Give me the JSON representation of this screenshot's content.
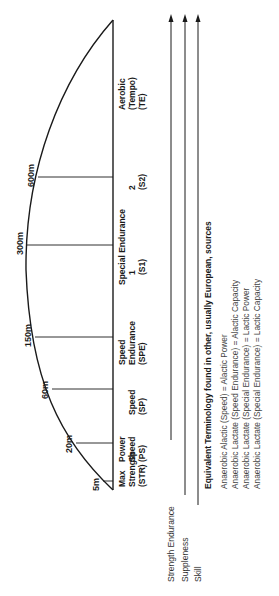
{
  "diagram": {
    "orientation": "rotated-90-ccw",
    "distances": [
      {
        "label": "5m",
        "y": 481,
        "x_curve": 103
      },
      {
        "label": "20m",
        "y": 443,
        "x_curve": 76
      },
      {
        "label": "60m",
        "y": 389,
        "x_curve": 52
      },
      {
        "label": "150m",
        "y": 337,
        "x_curve": 35
      },
      {
        "label": "300m",
        "y": 245,
        "x_curve": 27
      },
      {
        "label": "600m",
        "y": 177,
        "x_curve": 38
      }
    ],
    "zones": [
      {
        "lines": [
          "Max",
          "Strength",
          "(STR)"
        ],
        "y": 487
      },
      {
        "lines": [
          "Power",
          "Speed",
          "(PS)"
        ],
        "y": 462
      },
      {
        "lines": [
          "",
          "Speed",
          "(SP)"
        ],
        "y": 415
      },
      {
        "lines": [
          "Speed",
          "Endurance",
          "(SPE)"
        ],
        "y": 365
      },
      {
        "lines": [
          "Special Endurance",
          "1",
          "(S1)"
        ],
        "y": 285
      },
      {
        "lines": [
          "",
          "2",
          "(S2)"
        ],
        "y": 190
      },
      {
        "lines": [
          "Aerobic",
          "(Tempo)",
          "(TE)"
        ],
        "y": 110
      }
    ],
    "qualities": [
      {
        "label": "Strength Endurance",
        "x": 171,
        "end_y": 440
      },
      {
        "label": "Suppleness",
        "x": 185,
        "end_y": 495
      },
      {
        "label": "Skill",
        "x": 198,
        "end_y": 505
      }
    ],
    "equivalent": {
      "heading": "Equivalent Terminology found in other, usually European, sources",
      "items": [
        "Anaerobic Alactic (Speed) = Alactic Power",
        "Anaerobic Lactate (Speed Endurance) = Alactic Capacity",
        "Anaerobic Lactate (Special Endurance) = Lactic Power",
        "Anaerobic Lactate (Special Endurance) = Lactic Capacity"
      ]
    }
  }
}
